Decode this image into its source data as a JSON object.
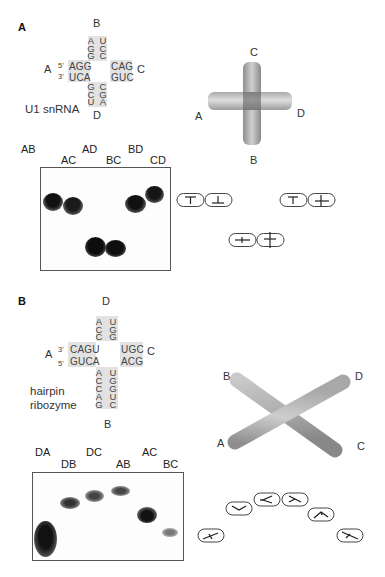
{
  "panelA": {
    "letter": "A",
    "junction": {
      "arm_labels": {
        "top": "B",
        "left": "A",
        "right": "C",
        "bottom": "D"
      },
      "left_strand_top": "AGG",
      "left_strand_bottom": "UCA",
      "prime_top": "5'",
      "prime_bottom": "3'",
      "right_strand_top": "CAG",
      "right_strand_bottom": "GUC",
      "top_col_left": [
        "A",
        "G",
        "G"
      ],
      "top_col_right": [
        "U",
        "C",
        "C"
      ],
      "bottom_col_left": [
        "G",
        "C",
        "U"
      ],
      "bottom_col_right": [
        "C",
        "G",
        "A"
      ],
      "name": "U1 snRNA"
    },
    "model": {
      "labels": {
        "top": "C",
        "left": "A",
        "right": "D",
        "bottom": "B"
      },
      "shape": "square-planar cross"
    },
    "gel": {
      "lanes_row1": [
        "AB",
        "AD",
        "BD"
      ],
      "lanes_row2": [
        "AC",
        "BC",
        "CD"
      ],
      "bands": [
        {
          "lane": "AB",
          "mobility": "slow"
        },
        {
          "lane": "AC",
          "mobility": "slow"
        },
        {
          "lane": "AD",
          "mobility": "fast"
        },
        {
          "lane": "BC",
          "mobility": "fast"
        },
        {
          "lane": "BD",
          "mobility": "slow"
        },
        {
          "lane": "CD",
          "mobility": "slowest"
        }
      ]
    },
    "schematics": [
      "T-shape pair",
      "inverted-T pair",
      "cross pair",
      "T-cross pair"
    ]
  },
  "panelB": {
    "letter": "B",
    "junction": {
      "arm_labels": {
        "top": "D",
        "left": "A",
        "right": "C",
        "bottom": "B"
      },
      "left_strand_top": "CAGU",
      "left_strand_bottom": "GUCA",
      "prime_top": "3'",
      "prime_bottom": "5'",
      "right_strand_top": "UGC",
      "right_strand_bottom": "ACG",
      "top_col_left": [
        "A",
        "C",
        "C"
      ],
      "top_col_right": [
        "U",
        "G",
        "G"
      ],
      "bottom_col_left": [
        "A",
        "C",
        "C",
        "A",
        "G"
      ],
      "bottom_col_right": [
        "U",
        "G",
        "G",
        "U",
        "C"
      ],
      "name_line1": "hairpin",
      "name_line2": "ribozyme"
    },
    "model": {
      "labels": {
        "topleft": "B",
        "topright": "D",
        "bottomleft": "A",
        "bottomright": "C"
      },
      "shape": "X-shaped stacked"
    },
    "gel": {
      "lanes_row1": [
        "DA",
        "DC",
        "AC"
      ],
      "lanes_row2": [
        "DB",
        "AB",
        "BC"
      ],
      "bands": [
        {
          "lane": "DA",
          "mobility": "fastest"
        },
        {
          "lane": "DB",
          "mobility": "slow"
        },
        {
          "lane": "DC",
          "mobility": "slower"
        },
        {
          "lane": "AB",
          "mobility": "slowest"
        },
        {
          "lane": "AC",
          "mobility": "intermediate"
        },
        {
          "lane": "BC",
          "mobility": "fast"
        }
      ]
    }
  }
}
